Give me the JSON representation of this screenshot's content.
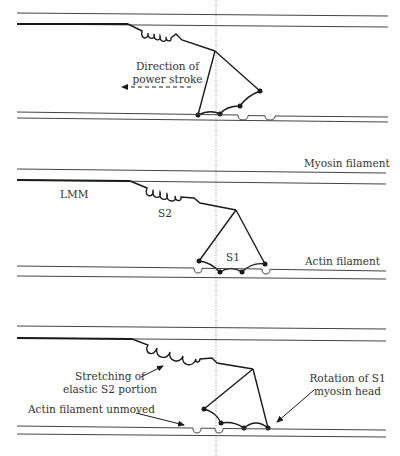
{
  "figure": {
    "reference_line": "dotted vertical reference line"
  },
  "panels": [
    {
      "id": "panel-1",
      "labels": {
        "direction_line1": "Direction of",
        "direction_line2": "power stroke"
      }
    },
    {
      "id": "panel-2",
      "labels": {
        "myosin": "Myosin filament",
        "lmm": "LMM",
        "s2": "S2",
        "s1": "S1",
        "actin": "Actin filament"
      }
    },
    {
      "id": "panel-3",
      "labels": {
        "stretch_line1": "Stretching of",
        "stretch_line2": "elastic S2 portion",
        "actin_unmoved": "Actin filament unmoved",
        "rotation_line1": "Rotation of S1",
        "rotation_line2": "myosin head"
      }
    }
  ],
  "colors": {
    "line": "#1a1a1a",
    "thin_line": "#444444",
    "text": "#333333",
    "background": "#ffffff"
  }
}
